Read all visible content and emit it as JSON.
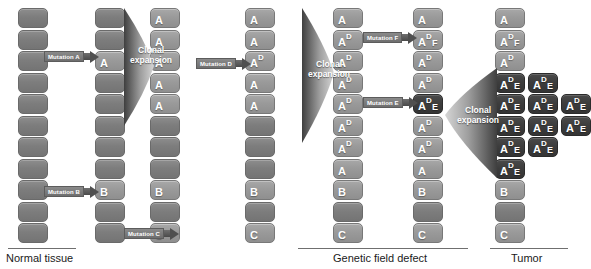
{
  "figure": {
    "colors": {
      "normal_cell": "#7d7d7d",
      "mutated_cell": "#9a9a9a",
      "tumor_cell": "#3d3d3d",
      "arrow": "#4f4f4f",
      "background": "#ffffff",
      "caption_text": "#1a1a1a",
      "cell_label": "#ffffff"
    }
  },
  "sections": [
    {
      "id": "normal-tissue",
      "label": "Normal tissue",
      "rule": {
        "x": 8,
        "y": 248,
        "w": 68
      },
      "caption": {
        "x": 6,
        "y": 252
      }
    },
    {
      "id": "genetic-field-defect",
      "label": "Genetic field defect",
      "rule": {
        "x": 298,
        "y": 248,
        "w": 170
      },
      "caption": {
        "x": 333,
        "y": 252
      }
    },
    {
      "id": "tumor",
      "label": "Tumor",
      "rule": {
        "x": 490,
        "y": 248,
        "w": 78
      },
      "caption": {
        "x": 511,
        "y": 252
      }
    }
  ],
  "columns": [
    {
      "id": "column-1-normal",
      "x": 18,
      "cells": [
        {
          "row": 1,
          "type": "normal",
          "base": "",
          "sup": "",
          "sub": ""
        },
        {
          "row": 2,
          "type": "normal",
          "base": "",
          "sup": "",
          "sub": ""
        },
        {
          "row": 3,
          "type": "normal",
          "base": "",
          "sup": "",
          "sub": ""
        },
        {
          "row": 4,
          "type": "normal",
          "base": "",
          "sup": "",
          "sub": ""
        },
        {
          "row": 5,
          "type": "normal",
          "base": "",
          "sup": "",
          "sub": ""
        },
        {
          "row": 6,
          "type": "normal",
          "base": "",
          "sup": "",
          "sub": ""
        },
        {
          "row": 7,
          "type": "normal",
          "base": "",
          "sup": "",
          "sub": ""
        },
        {
          "row": 8,
          "type": "normal",
          "base": "",
          "sup": "",
          "sub": ""
        },
        {
          "row": 9,
          "type": "normal",
          "base": "",
          "sup": "",
          "sub": ""
        },
        {
          "row": 10,
          "type": "normal",
          "base": "",
          "sup": "",
          "sub": ""
        },
        {
          "row": 11,
          "type": "normal",
          "base": "",
          "sup": "",
          "sub": ""
        }
      ]
    },
    {
      "id": "column-2-mutation-a-b",
      "x": 95,
      "cells": [
        {
          "row": 1,
          "type": "normal",
          "base": "",
          "sup": "",
          "sub": ""
        },
        {
          "row": 2,
          "type": "normal",
          "base": "",
          "sup": "",
          "sub": ""
        },
        {
          "row": 3,
          "type": "mut",
          "base": "A",
          "sup": "",
          "sub": ""
        },
        {
          "row": 4,
          "type": "normal",
          "base": "",
          "sup": "",
          "sub": ""
        },
        {
          "row": 5,
          "type": "normal",
          "base": "",
          "sup": "",
          "sub": ""
        },
        {
          "row": 6,
          "type": "normal",
          "base": "",
          "sup": "",
          "sub": ""
        },
        {
          "row": 7,
          "type": "normal",
          "base": "",
          "sup": "",
          "sub": ""
        },
        {
          "row": 8,
          "type": "normal",
          "base": "",
          "sup": "",
          "sub": ""
        },
        {
          "row": 9,
          "type": "mut",
          "base": "B",
          "sup": "",
          "sub": ""
        },
        {
          "row": 10,
          "type": "normal",
          "base": "",
          "sup": "",
          "sub": ""
        },
        {
          "row": 11,
          "type": "normal",
          "base": "",
          "sup": "",
          "sub": ""
        }
      ]
    },
    {
      "id": "column-3-clonal-a",
      "x": 150,
      "cells": [
        {
          "row": 1,
          "type": "mut",
          "base": "A",
          "sup": "",
          "sub": ""
        },
        {
          "row": 2,
          "type": "mut",
          "base": "A",
          "sup": "",
          "sub": ""
        },
        {
          "row": 3,
          "type": "mut",
          "base": "A",
          "sup": "",
          "sub": ""
        },
        {
          "row": 4,
          "type": "mut",
          "base": "A",
          "sup": "",
          "sub": ""
        },
        {
          "row": 5,
          "type": "mut",
          "base": "A",
          "sup": "",
          "sub": ""
        },
        {
          "row": 6,
          "type": "normal",
          "base": "",
          "sup": "",
          "sub": ""
        },
        {
          "row": 7,
          "type": "normal",
          "base": "",
          "sup": "",
          "sub": ""
        },
        {
          "row": 8,
          "type": "normal",
          "base": "",
          "sup": "",
          "sub": ""
        },
        {
          "row": 9,
          "type": "mut",
          "base": "B",
          "sup": "",
          "sub": ""
        },
        {
          "row": 10,
          "type": "normal",
          "base": "",
          "sup": "",
          "sub": ""
        },
        {
          "row": 11,
          "type": "mut",
          "base": "C",
          "sup": "",
          "sub": ""
        }
      ]
    },
    {
      "id": "column-4-mutation-d",
      "x": 245,
      "cells": [
        {
          "row": 1,
          "type": "mut",
          "base": "A",
          "sup": "",
          "sub": ""
        },
        {
          "row": 2,
          "type": "mut",
          "base": "A",
          "sup": "",
          "sub": ""
        },
        {
          "row": 3,
          "type": "mut",
          "base": "A",
          "sup": "D",
          "sub": ""
        },
        {
          "row": 4,
          "type": "mut",
          "base": "A",
          "sup": "",
          "sub": ""
        },
        {
          "row": 5,
          "type": "mut",
          "base": "A",
          "sup": "",
          "sub": ""
        },
        {
          "row": 6,
          "type": "normal",
          "base": "",
          "sup": "",
          "sub": ""
        },
        {
          "row": 7,
          "type": "normal",
          "base": "",
          "sup": "",
          "sub": ""
        },
        {
          "row": 8,
          "type": "normal",
          "base": "",
          "sup": "",
          "sub": ""
        },
        {
          "row": 9,
          "type": "mut",
          "base": "B",
          "sup": "",
          "sub": ""
        },
        {
          "row": 10,
          "type": "normal",
          "base": "",
          "sup": "",
          "sub": ""
        },
        {
          "row": 11,
          "type": "mut",
          "base": "C",
          "sup": "",
          "sub": ""
        }
      ]
    },
    {
      "id": "column-5-clonal-d",
      "x": 333,
      "cells": [
        {
          "row": 1,
          "type": "mut",
          "base": "A",
          "sup": "",
          "sub": ""
        },
        {
          "row": 2,
          "type": "mut",
          "base": "A",
          "sup": "D",
          "sub": ""
        },
        {
          "row": 3,
          "type": "mut",
          "base": "A",
          "sup": "D",
          "sub": ""
        },
        {
          "row": 4,
          "type": "mut",
          "base": "A",
          "sup": "D",
          "sub": ""
        },
        {
          "row": 5,
          "type": "mut",
          "base": "A",
          "sup": "D",
          "sub": ""
        },
        {
          "row": 6,
          "type": "mut",
          "base": "A",
          "sup": "D",
          "sub": ""
        },
        {
          "row": 7,
          "type": "mut",
          "base": "A",
          "sup": "D",
          "sub": ""
        },
        {
          "row": 8,
          "type": "mut",
          "base": "A",
          "sup": "",
          "sub": ""
        },
        {
          "row": 9,
          "type": "mut",
          "base": "B",
          "sup": "",
          "sub": ""
        },
        {
          "row": 10,
          "type": "normal",
          "base": "",
          "sup": "",
          "sub": ""
        },
        {
          "row": 11,
          "type": "mut",
          "base": "C",
          "sup": "",
          "sub": ""
        }
      ]
    },
    {
      "id": "column-6-mutation-e-f",
      "x": 413,
      "cells": [
        {
          "row": 1,
          "type": "mut",
          "base": "A",
          "sup": "",
          "sub": ""
        },
        {
          "row": 2,
          "type": "mut",
          "base": "A",
          "sup": "D",
          "sub": "F"
        },
        {
          "row": 3,
          "type": "mut",
          "base": "A",
          "sup": "D",
          "sub": ""
        },
        {
          "row": 4,
          "type": "mut",
          "base": "A",
          "sup": "D",
          "sub": ""
        },
        {
          "row": 5,
          "type": "tumor",
          "base": "A",
          "sup": "D",
          "sub": "E"
        },
        {
          "row": 6,
          "type": "mut",
          "base": "A",
          "sup": "D",
          "sub": ""
        },
        {
          "row": 7,
          "type": "mut",
          "base": "A",
          "sup": "D",
          "sub": ""
        },
        {
          "row": 8,
          "type": "mut",
          "base": "A",
          "sup": "",
          "sub": ""
        },
        {
          "row": 9,
          "type": "mut",
          "base": "B",
          "sup": "",
          "sub": ""
        },
        {
          "row": 10,
          "type": "normal",
          "base": "",
          "sup": "",
          "sub": ""
        },
        {
          "row": 11,
          "type": "mut",
          "base": "C",
          "sup": "",
          "sub": ""
        }
      ]
    },
    {
      "id": "column-7-tumor",
      "x": 495,
      "cells": [
        {
          "row": 1,
          "type": "mut",
          "base": "A",
          "sup": "",
          "sub": ""
        },
        {
          "row": 2,
          "type": "mut",
          "base": "A",
          "sup": "D",
          "sub": "F"
        },
        {
          "row": 3,
          "type": "mut",
          "base": "A",
          "sup": "D",
          "sub": ""
        },
        {
          "row": 4,
          "type": "tumor",
          "base": "A",
          "sup": "D",
          "sub": "E"
        },
        {
          "row": 5,
          "type": "tumor",
          "base": "A",
          "sup": "D",
          "sub": "E"
        },
        {
          "row": 6,
          "type": "tumor",
          "base": "A",
          "sup": "D",
          "sub": "E"
        },
        {
          "row": 7,
          "type": "tumor",
          "base": "A",
          "sup": "D",
          "sub": "E"
        },
        {
          "row": 8,
          "type": "tumor",
          "base": "A",
          "sup": "D",
          "sub": "E"
        },
        {
          "row": 9,
          "type": "mut",
          "base": "B",
          "sup": "",
          "sub": ""
        },
        {
          "row": 10,
          "type": "normal",
          "base": "",
          "sup": "",
          "sub": ""
        },
        {
          "row": 11,
          "type": "mut",
          "base": "C",
          "sup": "",
          "sub": ""
        }
      ]
    }
  ],
  "tumor_cluster": [
    {
      "col": 2,
      "row": 4,
      "type": "tumor",
      "base": "A",
      "sup": "D",
      "sub": "E"
    },
    {
      "col": 2,
      "row": 5,
      "type": "tumor",
      "base": "A",
      "sup": "D",
      "sub": "E"
    },
    {
      "col": 2,
      "row": 6,
      "type": "tumor",
      "base": "A",
      "sup": "D",
      "sub": "E"
    },
    {
      "col": 2,
      "row": 7,
      "type": "tumor",
      "base": "A",
      "sup": "D",
      "sub": "E"
    },
    {
      "col": 3,
      "row": 5,
      "type": "tumor",
      "base": "A",
      "sup": "D",
      "sub": "E"
    },
    {
      "col": 3,
      "row": 6,
      "type": "tumor",
      "base": "A",
      "sup": "D",
      "sub": "E"
    }
  ],
  "mutation_arrows": [
    {
      "id": "mutation-a",
      "label": "Mutation A",
      "x": 44,
      "y": 50
    },
    {
      "id": "mutation-b",
      "label": "Mutation B",
      "x": 44,
      "y": 185
    },
    {
      "id": "mutation-c",
      "label": "Mutation C",
      "x": 124,
      "y": 227
    },
    {
      "id": "mutation-d",
      "label": "Mutation D",
      "x": 196,
      "y": 57
    },
    {
      "id": "mutation-f",
      "label": "Mutation F",
      "x": 363,
      "y": 31
    },
    {
      "id": "mutation-e",
      "label": "Mutation E",
      "x": 363,
      "y": 96
    }
  ],
  "clonal_expansions": [
    {
      "id": "clonal-expansion-1",
      "label": "Clonal\nexpansion",
      "x": 124,
      "y": 8,
      "w": 30,
      "h": 118,
      "tip_y": 58,
      "text_x": 6,
      "text_y": 38
    },
    {
      "id": "clonal-expansion-2",
      "label": "Clonal\nexpansion",
      "x": 302,
      "y": 8,
      "w": 32,
      "h": 135,
      "tip_y": 65,
      "text_x": 6,
      "text_y": 52
    },
    {
      "id": "clonal-expansion-3",
      "label": "Clonal\nexpansion",
      "x": 445,
      "y": 68,
      "w": 52,
      "h": 110,
      "tip_y": 47,
      "text_x": 12,
      "text_y": 38,
      "flip": true
    }
  ],
  "clonal_label_text": "Clonal expansion",
  "legend_terms": [
    "Normal tissue",
    "Genetic field defect",
    "Tumor"
  ],
  "mutation_letters": [
    "A",
    "B",
    "C",
    "D",
    "E",
    "F"
  ]
}
